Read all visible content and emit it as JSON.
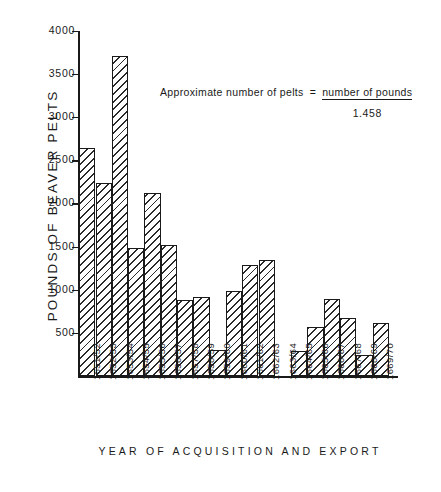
{
  "chart_data": {
    "type": "bar",
    "title": "",
    "xlabel": "YEAR  OF  ACQUISITION  AND  EXPORT",
    "ylabel": "POUNDS  OF  BEAVER  PELTS",
    "ylim": [
      0,
      4000
    ],
    "yticks": [
      500,
      1000,
      1500,
      2000,
      2500,
      3000,
      3500,
      4000
    ],
    "ytick_labels": [
      "500",
      "1000",
      "1500",
      "2000",
      "2500",
      "3000",
      "3500",
      "4000"
    ],
    "grid": false,
    "legend": null,
    "categories": [
      "1651/52",
      "1652/53",
      "1653/54",
      "1654/55",
      "1655/56",
      "1656/57",
      "1657/58",
      "1658/59",
      "1659/60",
      "1660/61",
      "1661/62",
      "1662/63",
      "1663/64",
      "1664/65",
      "1665/66",
      "1666/67",
      "1667/68",
      "1668/69",
      "1669/70"
    ],
    "values": [
      2640,
      2240,
      3700,
      1480,
      2120,
      1520,
      880,
      920,
      300,
      990,
      1290,
      1340,
      0,
      290,
      570,
      890,
      670,
      250,
      620
    ],
    "annotations": [
      {
        "id": "pelts-formula",
        "lhs": "Approximate  number  of  pelts",
        "equals": "=",
        "numerator": "number of pounds",
        "denominator": "1.458"
      }
    ]
  }
}
